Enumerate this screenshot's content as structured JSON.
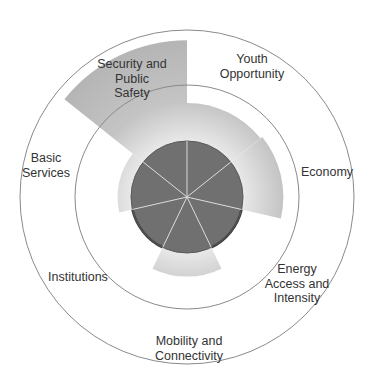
{
  "chart_data": {
    "type": "polar-area",
    "title": "",
    "scale_note": "Relative scores; reference ring = 100, core circle = 50",
    "reference_ring": 100,
    "outer_ring": 149,
    "baseline": 50,
    "categories": [
      "Youth Opportunity",
      "Economy",
      "Energy Access and Intensity",
      "Mobility and Connectivity",
      "Institutions",
      "Basic Services",
      "Security and Public Safety"
    ],
    "label_lines": [
      [
        "Youth",
        "Opportunity"
      ],
      [
        "Economy"
      ],
      [
        "Energy",
        "Access and",
        "Intensity"
      ],
      [
        "Mobility and",
        "Connectivity"
      ],
      [
        "Institutions"
      ],
      [
        "Basic",
        "Services"
      ],
      [
        "Security and",
        "Public",
        "Safety"
      ]
    ],
    "values": [
      84,
      86,
      50,
      71,
      50,
      62,
      140
    ],
    "colors": {
      "wedge": "#bdbdbd",
      "wedge_light": "#e6e6e6",
      "core": "#707070",
      "core_outline": "#3c3c3c",
      "ring": "#8a8a8a",
      "divider": "#d8d8d8"
    }
  }
}
